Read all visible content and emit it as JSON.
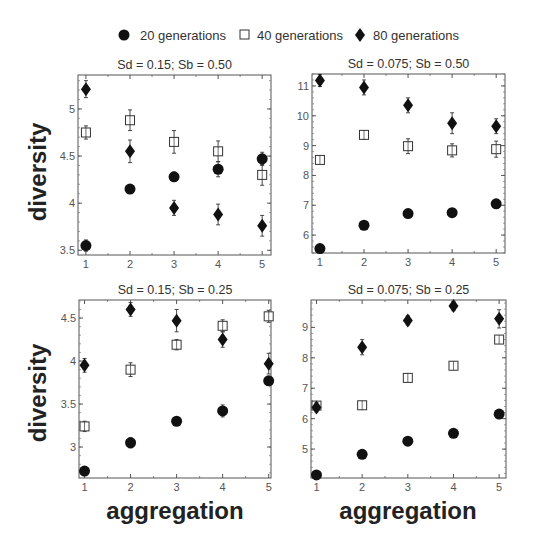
{
  "legend": {
    "items": [
      {
        "label": "20 generations",
        "marker": "filled-circle"
      },
      {
        "label": "40 generations",
        "marker": "open-square"
      },
      {
        "label": "80 generations",
        "marker": "filled-diamond"
      }
    ]
  },
  "axis_labels": {
    "y": "diversity",
    "x": "aggregation"
  },
  "chart_data": [
    {
      "type": "scatter",
      "title": "Sd = 0.15; Sb = 0.50",
      "xlabel": "aggregation",
      "ylabel": "diversity",
      "x": [
        1,
        2,
        3,
        4,
        5
      ],
      "xlim": [
        0.82,
        5.2
      ],
      "ylim": [
        3.45,
        5.36
      ],
      "yticks": [
        3.5,
        4,
        4.5,
        5
      ],
      "yticklabels": [
        "3.5",
        "4",
        "4.5",
        "5"
      ],
      "series": [
        {
          "name": "20 generations",
          "values": [
            3.55,
            4.15,
            4.28,
            4.36,
            4.47
          ],
          "errors": [
            0.06,
            0.04,
            0.05,
            0.08,
            0.07
          ]
        },
        {
          "name": "40 generations",
          "values": [
            4.75,
            4.88,
            4.65,
            4.55,
            4.3
          ],
          "errors": [
            0.07,
            0.11,
            0.12,
            0.11,
            0.11
          ]
        },
        {
          "name": "80 generations",
          "values": [
            5.21,
            4.55,
            3.95,
            3.88,
            3.76
          ],
          "errors": [
            0.09,
            0.12,
            0.08,
            0.11,
            0.11
          ]
        }
      ]
    },
    {
      "type": "scatter",
      "title": "Sd = 0.075; Sb = 0.50",
      "xlabel": "aggregation",
      "ylabel": "diversity",
      "x": [
        1,
        2,
        3,
        4,
        5
      ],
      "xlim": [
        0.82,
        5.2
      ],
      "ylim": [
        5.4,
        11.4
      ],
      "yticks": [
        6,
        7,
        8,
        9,
        10,
        11
      ],
      "yticklabels": [
        "6",
        "7",
        "8",
        "9",
        "10",
        "11"
      ],
      "series": [
        {
          "name": "20 generations",
          "values": [
            5.55,
            6.33,
            6.72,
            6.75,
            7.05
          ],
          "errors": [
            0.05,
            0.05,
            0.05,
            0.05,
            0.05
          ]
        },
        {
          "name": "40 generations",
          "values": [
            8.52,
            9.36,
            8.98,
            8.84,
            8.88
          ],
          "errors": [
            0.12,
            0.14,
            0.25,
            0.22,
            0.27
          ]
        },
        {
          "name": "80 generations",
          "values": [
            11.18,
            10.95,
            10.35,
            9.75,
            9.65
          ],
          "errors": [
            0.2,
            0.25,
            0.25,
            0.35,
            0.25
          ]
        }
      ]
    },
    {
      "type": "scatter",
      "title": "Sd = 0.15; Sb = 0.25",
      "xlabel": "aggregation",
      "ylabel": "diversity",
      "x": [
        1,
        2,
        3,
        4,
        5
      ],
      "xlim": [
        0.88,
        5.05
      ],
      "ylim": [
        2.64,
        4.71
      ],
      "yticks": [
        3,
        3.5,
        4,
        4.5
      ],
      "yticklabels": [
        "3",
        "3.5",
        "4",
        "4.5"
      ],
      "series": [
        {
          "name": "20 generations",
          "values": [
            2.72,
            3.05,
            3.3,
            3.42,
            3.77
          ],
          "errors": [
            0.03,
            0.06,
            0.04,
            0.07,
            0.04
          ]
        },
        {
          "name": "40 generations",
          "values": [
            3.24,
            3.9,
            4.19,
            4.41,
            4.52
          ],
          "errors": [
            0.06,
            0.08,
            0.06,
            0.07,
            0.07
          ]
        },
        {
          "name": "80 generations",
          "values": [
            3.95,
            4.6,
            4.47,
            4.25,
            3.97
          ],
          "errors": [
            0.08,
            0.08,
            0.13,
            0.09,
            0.12
          ]
        }
      ]
    },
    {
      "type": "scatter",
      "title": "Sd = 0.075; Sb = 0.25",
      "xlabel": "aggregation",
      "ylabel": "diversity",
      "x": [
        1,
        2,
        3,
        4,
        5
      ],
      "xlim": [
        0.88,
        5.15
      ],
      "ylim": [
        4.05,
        9.9
      ],
      "yticks": [
        5,
        6,
        7,
        8,
        9
      ],
      "yticklabels": [
        "5",
        "6",
        "7",
        "8",
        "9"
      ],
      "series": [
        {
          "name": "20 generations",
          "values": [
            4.15,
            4.83,
            5.26,
            5.52,
            6.15
          ],
          "errors": [
            0.05,
            0.05,
            0.05,
            0.05,
            0.05
          ]
        },
        {
          "name": "40 generations",
          "values": [
            6.43,
            6.44,
            7.34,
            7.74,
            8.6
          ],
          "errors": [
            0.12,
            0.12,
            0.12,
            0.12,
            0.1
          ]
        },
        {
          "name": "80 generations",
          "values": [
            6.37,
            8.35,
            9.23,
            9.7,
            9.28
          ],
          "errors": [
            0.15,
            0.25,
            0.15,
            0.15,
            0.3
          ]
        }
      ]
    }
  ]
}
